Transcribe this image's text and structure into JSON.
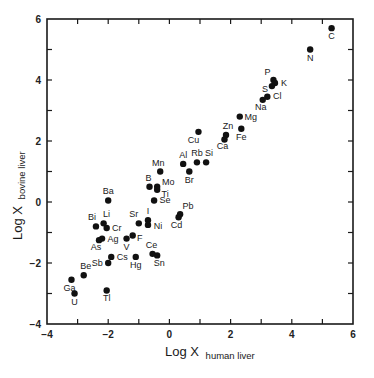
{
  "chart_data": {
    "type": "scatter",
    "title": "",
    "xlabel": "Log X human liver",
    "xlabel_main": "Log X",
    "xlabel_sub": "human liver",
    "ylabel": "Log X bovine liver",
    "ylabel_main": "Log X",
    "ylabel_sub": "bovine liver",
    "xlim": [
      -4,
      6
    ],
    "ylim": [
      -4,
      6
    ],
    "xticks": [
      -4,
      -3,
      -2,
      -1,
      0,
      1,
      2,
      3,
      4,
      5,
      6
    ],
    "yticks": [
      -4,
      -3,
      -2,
      -1,
      0,
      1,
      2,
      3,
      4,
      5,
      6
    ],
    "xtick_labels": [
      "-4",
      "-2",
      "0",
      "2",
      "4",
      "6"
    ],
    "ytick_labels": [
      "-4",
      "-2",
      "0",
      "2",
      "4",
      "6"
    ],
    "grid": false,
    "legend": null,
    "marker_color": "#111111",
    "points": [
      {
        "label": "C",
        "x": 5.3,
        "y": 5.7,
        "lx": 0,
        "ly": 11
      },
      {
        "label": "N",
        "x": 4.6,
        "y": 5.0,
        "lx": 0,
        "ly": 11
      },
      {
        "label": "P",
        "x": 3.4,
        "y": 4.0,
        "lx": -6,
        "ly": -5
      },
      {
        "label": "K",
        "x": 3.45,
        "y": 3.9,
        "lx": 9,
        "ly": 3
      },
      {
        "label": "S",
        "x": 3.35,
        "y": 3.8,
        "lx": -7,
        "ly": 6
      },
      {
        "label": "Cl",
        "x": 3.2,
        "y": 3.45,
        "lx": 10,
        "ly": 2
      },
      {
        "label": "Na",
        "x": 3.05,
        "y": 3.35,
        "lx": -2,
        "ly": 10
      },
      {
        "label": "Mg",
        "x": 2.3,
        "y": 2.8,
        "lx": 11,
        "ly": 3
      },
      {
        "label": "Fe",
        "x": 2.35,
        "y": 2.4,
        "lx": 0,
        "ly": 11
      },
      {
        "label": "Zn",
        "x": 1.85,
        "y": 2.2,
        "lx": 2,
        "ly": -6
      },
      {
        "label": "Ca",
        "x": 1.8,
        "y": 2.05,
        "lx": -2,
        "ly": 10
      },
      {
        "label": "Cu",
        "x": 0.95,
        "y": 2.3,
        "lx": -5,
        "ly": 11
      },
      {
        "label": "Al",
        "x": 0.45,
        "y": 1.25,
        "lx": 0,
        "ly": -6
      },
      {
        "label": "Rb",
        "x": 0.9,
        "y": 1.3,
        "lx": 0,
        "ly": -6
      },
      {
        "label": "Si",
        "x": 1.2,
        "y": 1.3,
        "lx": 3,
        "ly": -6
      },
      {
        "label": "Br",
        "x": 0.65,
        "y": 1.0,
        "lx": 0,
        "ly": 11
      },
      {
        "label": "Mn",
        "x": -0.3,
        "y": 1.0,
        "lx": -2,
        "ly": -6
      },
      {
        "label": "B",
        "x": -0.65,
        "y": 0.5,
        "lx": -1,
        "ly": -6
      },
      {
        "label": "Mo",
        "x": -0.4,
        "y": 0.5,
        "lx": 11,
        "ly": -2
      },
      {
        "label": "Ti",
        "x": -0.4,
        "y": 0.4,
        "lx": 8,
        "ly": 7
      },
      {
        "label": "Se",
        "x": -0.5,
        "y": 0.05,
        "lx": 11,
        "ly": 3
      },
      {
        "label": "Pb",
        "x": 0.35,
        "y": -0.4,
        "lx": 8,
        "ly": -5
      },
      {
        "label": "Cd",
        "x": 0.3,
        "y": -0.5,
        "lx": -2,
        "ly": 11
      },
      {
        "label": "Sr",
        "x": -1.0,
        "y": -0.7,
        "lx": -5,
        "ly": -6
      },
      {
        "label": "I",
        "x": -0.7,
        "y": -0.6,
        "lx": 0,
        "ly": -6
      },
      {
        "label": "Ni",
        "x": -0.7,
        "y": -0.75,
        "lx": 10,
        "ly": 4
      },
      {
        "label": "F",
        "x": -1.2,
        "y": -1.1,
        "lx": 7,
        "ly": 5
      },
      {
        "label": "Ba",
        "x": -2.0,
        "y": 0.05,
        "lx": 0,
        "ly": -6
      },
      {
        "label": "Bi",
        "x": -2.4,
        "y": -0.8,
        "lx": -4,
        "ly": -6
      },
      {
        "label": "Li",
        "x": -2.15,
        "y": -0.7,
        "lx": 3,
        "ly": -6
      },
      {
        "label": "Cr",
        "x": -2.05,
        "y": -0.85,
        "lx": 10,
        "ly": 3
      },
      {
        "label": "Ag",
        "x": -2.2,
        "y": -1.2,
        "lx": 11,
        "ly": 3
      },
      {
        "label": "As",
        "x": -2.3,
        "y": -1.25,
        "lx": -3,
        "ly": 10
      },
      {
        "label": "V",
        "x": -1.4,
        "y": -1.2,
        "lx": 0,
        "ly": 11
      },
      {
        "label": "Cs",
        "x": -1.9,
        "y": -1.8,
        "lx": 11,
        "ly": 3
      },
      {
        "label": "Sb",
        "x": -2.0,
        "y": -2.0,
        "lx": -11,
        "ly": 3
      },
      {
        "label": "Hg",
        "x": -1.1,
        "y": -1.8,
        "lx": 0,
        "ly": 11
      },
      {
        "label": "Ce",
        "x": -0.55,
        "y": -1.7,
        "lx": -1,
        "ly": -6
      },
      {
        "label": "Sn",
        "x": -0.4,
        "y": -1.75,
        "lx": 2,
        "ly": 11
      },
      {
        "label": "Be",
        "x": -2.8,
        "y": -2.4,
        "lx": 2,
        "ly": -6
      },
      {
        "label": "Ga",
        "x": -3.2,
        "y": -2.55,
        "lx": -2,
        "ly": 11
      },
      {
        "label": "U",
        "x": -3.1,
        "y": -3.0,
        "lx": 0,
        "ly": 11
      },
      {
        "label": "Tl",
        "x": -2.05,
        "y": -2.9,
        "lx": 0,
        "ly": 11
      }
    ]
  }
}
